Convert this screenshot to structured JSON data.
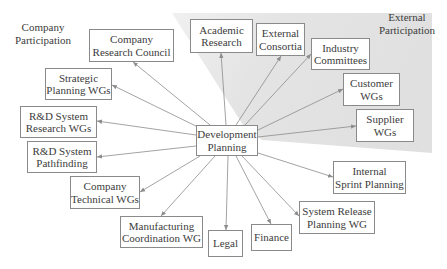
{
  "diagram": {
    "center": {
      "id": "development-planning",
      "lines": [
        "Development",
        "Planning"
      ],
      "box": [
        196,
        125,
        62,
        31
      ]
    },
    "region_labels": {
      "company": {
        "lines": [
          "Company",
          "Participation"
        ],
        "pos": [
          12,
          21,
          62
        ]
      },
      "external": {
        "lines": [
          "External",
          "Participation"
        ],
        "pos": [
          378,
          11,
          58
        ]
      }
    },
    "shaded_region": {
      "color": "#e3e3e3",
      "points": "172,13 432,13 432,153 262,140 243,125"
    },
    "nodes": [
      {
        "id": "company-research-council",
        "lines": [
          "Company",
          "Research Council"
        ],
        "box": [
          89,
          29,
          85,
          33
        ],
        "group": "company",
        "anchor": [
          133,
          62
        ]
      },
      {
        "id": "strategic-planning-wgs",
        "lines": [
          "Strategic",
          "Planning WGs"
        ],
        "box": [
          45,
          68,
          67,
          32
        ],
        "group": "company",
        "anchor": [
          112,
          85
        ]
      },
      {
        "id": "rnd-system-research-wgs",
        "lines": [
          "R&D System",
          "Research WGs"
        ],
        "box": [
          20,
          106,
          77,
          32
        ],
        "group": "company",
        "anchor": [
          97,
          121
        ]
      },
      {
        "id": "rnd-system-pathfinding",
        "lines": [
          "R&D System",
          "Pathfinding"
        ],
        "box": [
          27,
          141,
          70,
          32
        ],
        "group": "company",
        "anchor": [
          97,
          157
        ]
      },
      {
        "id": "company-technical-wgs",
        "lines": [
          "Company",
          "Technical WGs"
        ],
        "box": [
          70,
          176,
          70,
          33
        ],
        "group": "company",
        "anchor": [
          140,
          192
        ]
      },
      {
        "id": "manufacturing-coordination-wg",
        "lines": [
          "Manufacturing",
          "Coordination WG"
        ],
        "box": [
          120,
          216,
          83,
          32
        ],
        "group": "company",
        "anchor": [
          161,
          216
        ]
      },
      {
        "id": "legal",
        "lines": [
          "Legal"
        ],
        "box": [
          208,
          230,
          35,
          27
        ],
        "group": "company",
        "anchor": [
          226,
          230
        ]
      },
      {
        "id": "finance",
        "lines": [
          "Finance"
        ],
        "box": [
          251,
          224,
          41,
          27
        ],
        "group": "company",
        "anchor": [
          271,
          224
        ]
      },
      {
        "id": "system-release-planning-wg",
        "lines": [
          "System Release",
          "Planning WG"
        ],
        "box": [
          299,
          201,
          76,
          33
        ],
        "group": "company",
        "anchor": [
          299,
          216
        ]
      },
      {
        "id": "internal-sprint-planning",
        "lines": [
          "Internal",
          "Sprint Planning"
        ],
        "box": [
          333,
          161,
          73,
          33
        ],
        "group": "company",
        "anchor": [
          333,
          177
        ]
      },
      {
        "id": "supplier-wgs",
        "lines": [
          "Supplier",
          "WGs"
        ],
        "box": [
          356,
          109,
          58,
          33
        ],
        "group": "external",
        "anchor": [
          356,
          126
        ]
      },
      {
        "id": "customer-wgs",
        "lines": [
          "Customer",
          "WGs"
        ],
        "box": [
          343,
          73,
          57,
          33
        ],
        "group": "external",
        "anchor": [
          343,
          89
        ]
      },
      {
        "id": "industry-committees",
        "lines": [
          "Industry",
          "Committees"
        ],
        "box": [
          311,
          38,
          59,
          32
        ],
        "group": "external",
        "anchor": [
          311,
          54
        ]
      },
      {
        "id": "external-consortia",
        "lines": [
          "External",
          "Consortia"
        ],
        "box": [
          256,
          23,
          49,
          33
        ],
        "group": "external",
        "anchor": [
          281,
          56
        ]
      },
      {
        "id": "academic-research",
        "lines": [
          "Academic",
          "Research"
        ],
        "box": [
          190,
          19,
          63,
          34
        ],
        "group": "external",
        "anchor": [
          221,
          53
        ]
      }
    ],
    "edges_from": [
      {
        "to": "company-research-council",
        "from": [
          210,
          125
        ]
      },
      {
        "to": "strategic-planning-wgs",
        "from": [
          200,
          128
        ]
      },
      {
        "to": "rnd-system-research-wgs",
        "from": [
          196,
          135
        ]
      },
      {
        "to": "rnd-system-pathfinding",
        "from": [
          196,
          146
        ]
      },
      {
        "to": "company-technical-wgs",
        "from": [
          200,
          156
        ]
      },
      {
        "to": "manufacturing-coordination-wg",
        "from": [
          215,
          156
        ]
      },
      {
        "to": "legal",
        "from": [
          228,
          156
        ]
      },
      {
        "to": "finance",
        "from": [
          236,
          156
        ]
      },
      {
        "to": "system-release-planning-wg",
        "from": [
          242,
          156
        ]
      },
      {
        "to": "internal-sprint-planning",
        "from": [
          258,
          153
        ]
      },
      {
        "to": "supplier-wgs",
        "from": [
          258,
          137
        ]
      },
      {
        "to": "customer-wgs",
        "from": [
          258,
          130
        ]
      },
      {
        "to": "industry-committees",
        "from": [
          245,
          125
        ]
      },
      {
        "to": "external-consortia",
        "from": [
          236,
          125
        ]
      },
      {
        "to": "academic-research",
        "from": [
          226,
          125
        ]
      }
    ],
    "colors": {
      "edge": "#8c8c8c",
      "border": "#8a8a8a",
      "text": "#3c3c3c",
      "shade": "#e3e3e3"
    }
  }
}
